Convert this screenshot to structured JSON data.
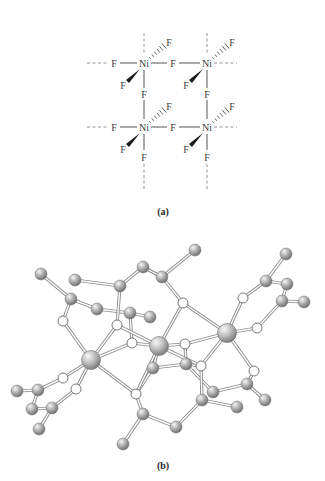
{
  "figure": {
    "panel_a": {
      "caption": "(a)",
      "metal_label": "Ni",
      "ligand_label": "F",
      "nickel_centers": [
        {
          "id": "Ni1",
          "x": 144,
          "y": 63
        },
        {
          "id": "Ni2",
          "x": 207,
          "y": 63
        },
        {
          "id": "Ni3",
          "x": 144,
          "y": 127
        },
        {
          "id": "Ni4",
          "x": 207,
          "y": 127
        }
      ]
    },
    "panel_b": {
      "caption": "(b)",
      "atoms": [
        {
          "id": "Ni_L",
          "type": "metal"
        },
        {
          "id": "Ni_C",
          "type": "metal"
        },
        {
          "id": "Ni_R",
          "type": "metal"
        }
      ]
    }
  }
}
